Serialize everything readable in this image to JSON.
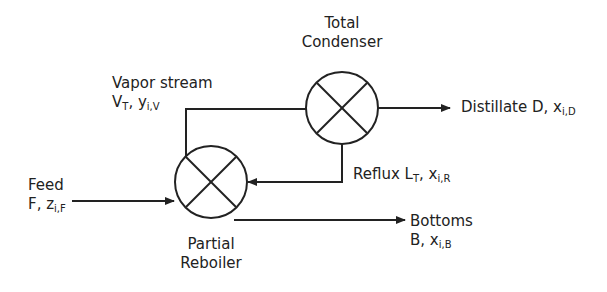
{
  "units": {
    "condenser": {
      "line1": "Total",
      "line2": "Condenser"
    },
    "reboiler": {
      "line1": "Partial",
      "line2": "Reboiler"
    }
  },
  "streams": {
    "vapor": {
      "line1": "Vapor stream",
      "sym1": "V",
      "sub1": "T",
      "sep": ", ",
      "sym2": "y",
      "sub2": "i,V"
    },
    "distillate": {
      "text": "Distillate D, ",
      "sym": "x",
      "sub": "i,D"
    },
    "reflux": {
      "text": "Reflux ",
      "sym1": "L",
      "sub1": "T",
      "sep": ", ",
      "sym2": "x",
      "sub2": "i,R"
    },
    "feed": {
      "line1": "Feed",
      "text2": "F, ",
      "sym": "z",
      "sub": "i,F"
    },
    "bottoms": {
      "line1": "Bottoms",
      "text2": "B, ",
      "sym": "x",
      "sub": "i,B"
    }
  },
  "colors": {
    "line": "#222222",
    "background": "#ffffff"
  }
}
